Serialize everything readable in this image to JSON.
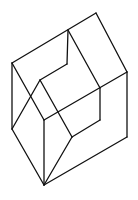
{
  "diagram": {
    "type": "line-drawing",
    "stroke_color": "#111111",
    "background_color": "#ffffff",
    "vertices": {
      "A": [
        12,
        63
      ],
      "B": [
        96,
        13
      ],
      "C": [
        127,
        72
      ],
      "D": [
        127,
        137
      ],
      "E": [
        44,
        185
      ],
      "F": [
        12,
        129
      ],
      "G": [
        68,
        30
      ],
      "H": [
        67,
        64
      ],
      "I": [
        40,
        80
      ],
      "J": [
        100,
        88
      ],
      "K": [
        100,
        120
      ],
      "L": [
        72,
        137
      ],
      "M": [
        44,
        120
      ]
    },
    "edges": [
      [
        "A",
        "B"
      ],
      [
        "B",
        "C"
      ],
      [
        "C",
        "D"
      ],
      [
        "D",
        "E"
      ],
      [
        "E",
        "F"
      ],
      [
        "F",
        "A"
      ],
      [
        "G",
        "J"
      ],
      [
        "G",
        "H"
      ],
      [
        "H",
        "I"
      ],
      [
        "I",
        "F"
      ],
      [
        "A",
        "M"
      ],
      [
        "M",
        "E"
      ],
      [
        "M",
        "C"
      ],
      [
        "I",
        "L"
      ],
      [
        "J",
        "K"
      ],
      [
        "K",
        "L"
      ],
      [
        "L",
        "E"
      ]
    ]
  }
}
